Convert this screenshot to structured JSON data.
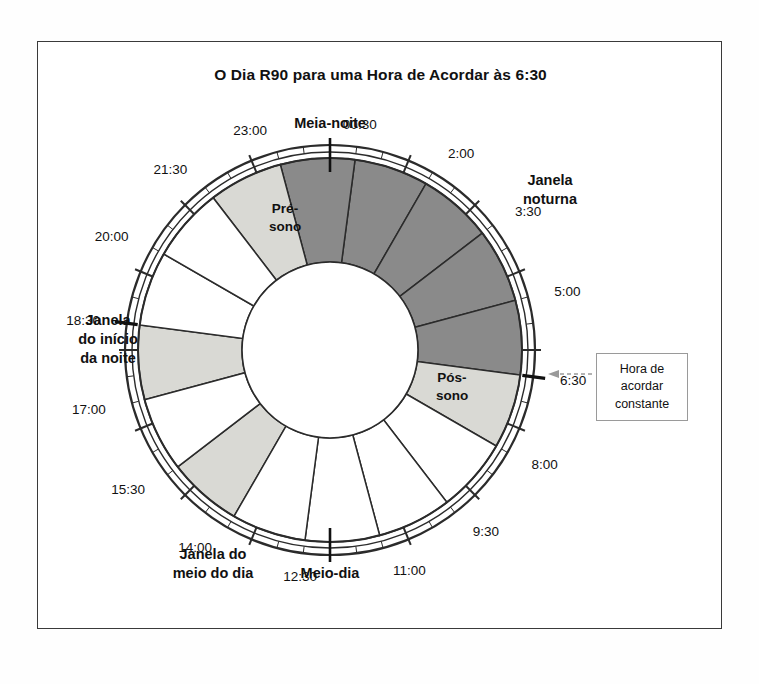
{
  "title": "O Dia R90 para uma Hora de Acordar às 6:30",
  "callout": {
    "line1": "Hora de",
    "line2": "acordar",
    "line3": "constante"
  },
  "cardinal_labels": {
    "midnight": "Meia-noite",
    "noon": "Meio-dia"
  },
  "window_labels": [
    {
      "id": "night-window",
      "line1": "Janela",
      "line2": "noturna"
    },
    {
      "id": "evening-window",
      "line1": "Janela",
      "line2": "do início",
      "line3": "da noite"
    },
    {
      "id": "midday-window",
      "line1": "Janela do",
      "line2": "meio do dia"
    }
  ],
  "segment_labels": [
    {
      "id": "pre-sleep",
      "line1": "Pré-",
      "line2": "sono"
    },
    {
      "id": "post-sleep",
      "line1": "Pós-",
      "line2": "sono"
    }
  ],
  "chart_data": {
    "type": "pie",
    "title": "O Dia R90 para uma Hora de Acordar às 6:30",
    "cycle_minutes": 90,
    "wake_time": "6:30",
    "tick_labels": [
      "00:30",
      "2:00",
      "3:30",
      "5:00",
      "6:30",
      "8:00",
      "9:30",
      "11:00",
      "12:30",
      "14:00",
      "15:30",
      "17:00",
      "18:30",
      "20:00",
      "21:30",
      "23:00"
    ],
    "cardinal_ticks": [
      {
        "label": "Meia-noite",
        "time": "00:00"
      },
      {
        "label": "Meio-dia",
        "time": "12:00"
      }
    ],
    "segments": [
      {
        "start": "00:30",
        "end": "2:00",
        "fill": "dark"
      },
      {
        "start": "2:00",
        "end": "3:30",
        "fill": "dark"
      },
      {
        "start": "3:30",
        "end": "5:00",
        "fill": "dark"
      },
      {
        "start": "5:00",
        "end": "6:30",
        "fill": "dark"
      },
      {
        "start": "23:00",
        "end": "00:30",
        "fill": "dark"
      },
      {
        "start": "21:30",
        "end": "23:00",
        "fill": "light",
        "label": "Pré-sono"
      },
      {
        "start": "6:30",
        "end": "8:00",
        "fill": "light",
        "label": "Pós-sono"
      },
      {
        "start": "17:00",
        "end": "18:30",
        "fill": "light"
      },
      {
        "start": "14:00",
        "end": "15:30",
        "fill": "light"
      },
      {
        "start": "8:00",
        "end": "9:30",
        "fill": "white"
      },
      {
        "start": "9:30",
        "end": "11:00",
        "fill": "white"
      },
      {
        "start": "11:00",
        "end": "12:30",
        "fill": "white"
      },
      {
        "start": "12:30",
        "end": "14:00",
        "fill": "white"
      },
      {
        "start": "15:30",
        "end": "17:00",
        "fill": "white"
      },
      {
        "start": "18:30",
        "end": "20:00",
        "fill": "white"
      },
      {
        "start": "20:00",
        "end": "21:30",
        "fill": "white"
      }
    ],
    "colors": {
      "dark": "#8a8a8a",
      "light": "#d9d9d4",
      "white": "#ffffff",
      "stroke": "#2b2b2b"
    }
  }
}
